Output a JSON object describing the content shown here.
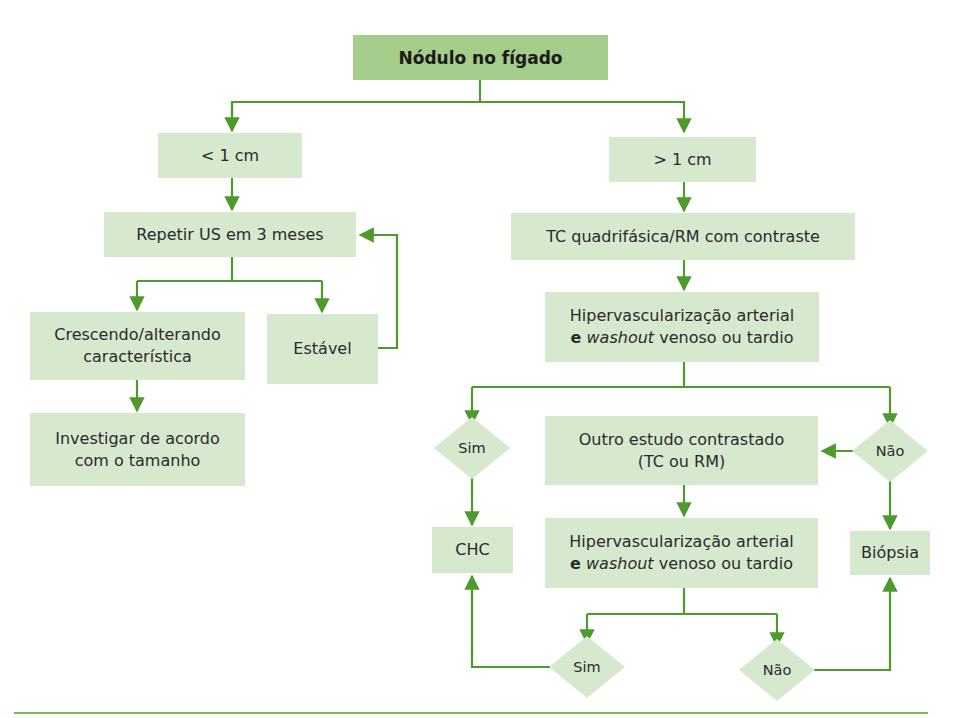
{
  "colors": {
    "title_fill": "#a4cc8a",
    "box_fill": "#d6e9cf",
    "connector": "#4f9a2e",
    "rule": "#7fb36a"
  },
  "flowchart": {
    "root": {
      "label": "Nódulo no fígado"
    },
    "left_branch": {
      "condition": "< 1 cm",
      "step1": "Repetir US em 3 meses",
      "growing": {
        "line1": "Crescendo/alterando",
        "line2": "característica"
      },
      "stable": "Estável",
      "investigate": {
        "line1": "Investigar de acordo",
        "line2": "com o tamanho"
      }
    },
    "right_branch": {
      "condition": "> 1 cm",
      "step1": "TC quadrifásica/RM com contraste",
      "criteria1": {
        "line1": "Hipervascularização arterial",
        "bold": "e",
        "italic": "washout",
        "rest": "venoso ou tardio"
      },
      "yes1": "Sim",
      "no1": "Não",
      "other_study": {
        "line1": "Outro estudo contrastado",
        "line2": "(TC ou RM)"
      },
      "criteria2": {
        "line1": "Hipervascularização arterial",
        "bold": "e",
        "italic": "washout",
        "rest": "venoso ou tardio"
      },
      "yes2": "Sim",
      "no2": "Não",
      "chc": "CHC",
      "biopsy": "Biópsia"
    }
  }
}
